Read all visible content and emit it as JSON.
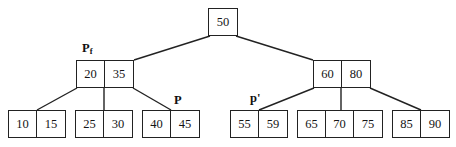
{
  "diagram": {
    "stroke_color": "#222222",
    "background_color": "#ffffff",
    "text_color": "#151515"
  },
  "nodes": [
    {
      "id": "root",
      "level": 0,
      "keys": [
        "50"
      ],
      "x": 208,
      "y": 8,
      "w": 30,
      "h": 28
    },
    {
      "id": "internal-left",
      "level": 1,
      "keys": [
        "20",
        "35"
      ],
      "x": 76,
      "y": 60,
      "w": 58,
      "h": 28
    },
    {
      "id": "internal-right",
      "level": 1,
      "keys": [
        "60",
        "80"
      ],
      "x": 313,
      "y": 60,
      "w": 58,
      "h": 28
    },
    {
      "id": "leaf-1",
      "level": 2,
      "keys": [
        "10",
        "15"
      ],
      "x": 8,
      "y": 110,
      "w": 58,
      "h": 28
    },
    {
      "id": "leaf-2",
      "level": 2,
      "keys": [
        "25",
        "30"
      ],
      "x": 75,
      "y": 110,
      "w": 58,
      "h": 28
    },
    {
      "id": "leaf-3",
      "level": 2,
      "keys": [
        "40",
        "45"
      ],
      "x": 142,
      "y": 110,
      "w": 58,
      "h": 28
    },
    {
      "id": "leaf-4",
      "level": 2,
      "keys": [
        "55",
        "59"
      ],
      "x": 230,
      "y": 110,
      "w": 58,
      "h": 28
    },
    {
      "id": "leaf-5",
      "level": 2,
      "keys": [
        "65",
        "70",
        "75"
      ],
      "x": 297,
      "y": 110,
      "w": 86,
      "h": 28
    },
    {
      "id": "leaf-6",
      "level": 2,
      "keys": [
        "85",
        "90"
      ],
      "x": 392,
      "y": 110,
      "w": 58,
      "h": 28
    }
  ],
  "pointer_labels": [
    {
      "id": "pf",
      "base": "P",
      "sub": "f",
      "prime": "",
      "x": 82,
      "y": 42
    },
    {
      "id": "p",
      "base": "P",
      "sub": "",
      "prime": "",
      "x": 174,
      "y": 94
    },
    {
      "id": "p-prime",
      "base": "p",
      "sub": "",
      "prime": "'",
      "x": 250,
      "y": 92
    }
  ],
  "edges": [
    {
      "id": "root-to-left",
      "x1": 210,
      "y1": 36,
      "x2": 134,
      "y2": 60
    },
    {
      "id": "root-to-right",
      "x1": 236,
      "y1": 36,
      "x2": 313,
      "y2": 60
    },
    {
      "id": "left-to-leaf1",
      "x1": 77,
      "y1": 88,
      "x2": 37,
      "y2": 110
    },
    {
      "id": "left-to-leaf2",
      "x1": 104,
      "y1": 88,
      "x2": 104,
      "y2": 110
    },
    {
      "id": "left-to-leaf3",
      "x1": 133,
      "y1": 88,
      "x2": 171,
      "y2": 110
    },
    {
      "id": "right-to-leaf4",
      "x1": 314,
      "y1": 88,
      "x2": 259,
      "y2": 110
    },
    {
      "id": "right-to-leaf5",
      "x1": 341,
      "y1": 88,
      "x2": 341,
      "y2": 110
    },
    {
      "id": "right-to-leaf6",
      "x1": 370,
      "y1": 88,
      "x2": 421,
      "y2": 110
    }
  ]
}
